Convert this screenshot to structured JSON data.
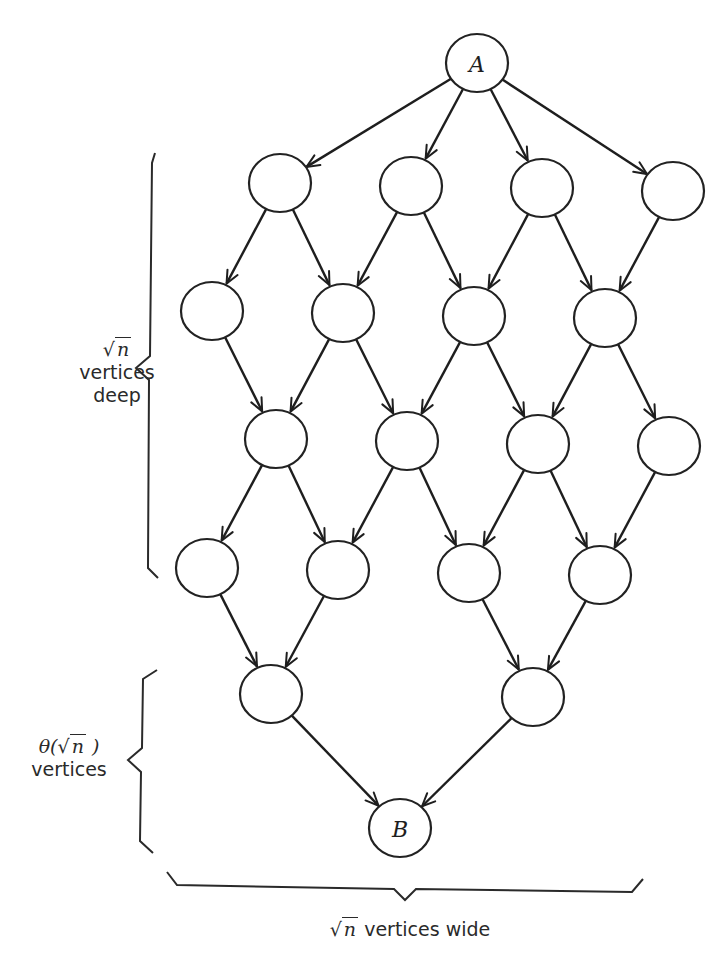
{
  "diagram": {
    "nodes": [
      {
        "id": "A",
        "label": "A",
        "x": 477,
        "y": 63
      },
      {
        "id": "r1c0",
        "label": "",
        "x": 280,
        "y": 183
      },
      {
        "id": "r1c1",
        "label": "",
        "x": 411,
        "y": 186
      },
      {
        "id": "r1c2",
        "label": "",
        "x": 542,
        "y": 188
      },
      {
        "id": "r1c3",
        "label": "",
        "x": 673,
        "y": 191
      },
      {
        "id": "r2c0",
        "label": "",
        "x": 212,
        "y": 311
      },
      {
        "id": "r2c1",
        "label": "",
        "x": 343,
        "y": 313
      },
      {
        "id": "r2c2",
        "label": "",
        "x": 474,
        "y": 316
      },
      {
        "id": "r2c3",
        "label": "",
        "x": 605,
        "y": 318
      },
      {
        "id": "r3c0",
        "label": "",
        "x": 276,
        "y": 439
      },
      {
        "id": "r3c1",
        "label": "",
        "x": 407,
        "y": 441
      },
      {
        "id": "r3c2",
        "label": "",
        "x": 538,
        "y": 444
      },
      {
        "id": "r3c3",
        "label": "",
        "x": 669,
        "y": 446
      },
      {
        "id": "r4c0",
        "label": "",
        "x": 207,
        "y": 568
      },
      {
        "id": "r4c1",
        "label": "",
        "x": 338,
        "y": 570
      },
      {
        "id": "r4c2",
        "label": "",
        "x": 469,
        "y": 573
      },
      {
        "id": "r4c3",
        "label": "",
        "x": 600,
        "y": 575
      },
      {
        "id": "r5c0",
        "label": "",
        "x": 271,
        "y": 694
      },
      {
        "id": "r5c1",
        "label": "",
        "x": 533,
        "y": 697
      },
      {
        "id": "B",
        "label": "B",
        "x": 400,
        "y": 828
      }
    ],
    "node_radius": 30,
    "edges": [
      [
        "A",
        "r1c0"
      ],
      [
        "A",
        "r1c1"
      ],
      [
        "A",
        "r1c2"
      ],
      [
        "A",
        "r1c3"
      ],
      [
        "r1c0",
        "r2c0"
      ],
      [
        "r1c0",
        "r2c1"
      ],
      [
        "r1c1",
        "r2c1"
      ],
      [
        "r1c1",
        "r2c2"
      ],
      [
        "r1c2",
        "r2c2"
      ],
      [
        "r1c2",
        "r2c3"
      ],
      [
        "r1c3",
        "r2c3"
      ],
      [
        "r2c0",
        "r3c0"
      ],
      [
        "r2c1",
        "r3c0"
      ],
      [
        "r2c1",
        "r3c1"
      ],
      [
        "r2c2",
        "r3c1"
      ],
      [
        "r2c2",
        "r3c2"
      ],
      [
        "r2c3",
        "r3c2"
      ],
      [
        "r2c3",
        "r3c3"
      ],
      [
        "r3c0",
        "r4c0"
      ],
      [
        "r3c0",
        "r4c1"
      ],
      [
        "r3c1",
        "r4c1"
      ],
      [
        "r3c1",
        "r4c2"
      ],
      [
        "r3c2",
        "r4c2"
      ],
      [
        "r3c2",
        "r4c3"
      ],
      [
        "r3c3",
        "r4c3"
      ],
      [
        "r4c0",
        "r5c0"
      ],
      [
        "r4c1",
        "r5c0"
      ],
      [
        "r4c2",
        "r5c1"
      ],
      [
        "r4c3",
        "r5c1"
      ],
      [
        "r5c0",
        "B"
      ],
      [
        "r5c1",
        "B"
      ]
    ],
    "braces": [
      {
        "id": "depth-brace",
        "points": "155,153 152,163 150,356 136,368 149,380 148,568 158,578"
      },
      {
        "id": "theta-brace",
        "points": "157,670 143,679 142,748 128,760 141,772 140,841 153,853"
      },
      {
        "id": "width-brace",
        "points": "167,872 177,885 394,889 405,900 416,889 632,892 643,879"
      }
    ],
    "annotations": {
      "depth": {
        "sqrt_symbol": "√",
        "radicand": "n",
        "line2": "vertices",
        "line3": "deep"
      },
      "theta": {
        "prefix": "θ(",
        "sqrt_symbol": "√",
        "radicand": "n",
        "suffix": " )",
        "line2": "vertices"
      },
      "width": {
        "sqrt_symbol": "√",
        "radicand": "n",
        "text": " vertices wide"
      }
    },
    "colors": {
      "ink": "#1e1e1e",
      "background": "#ffffff"
    }
  }
}
